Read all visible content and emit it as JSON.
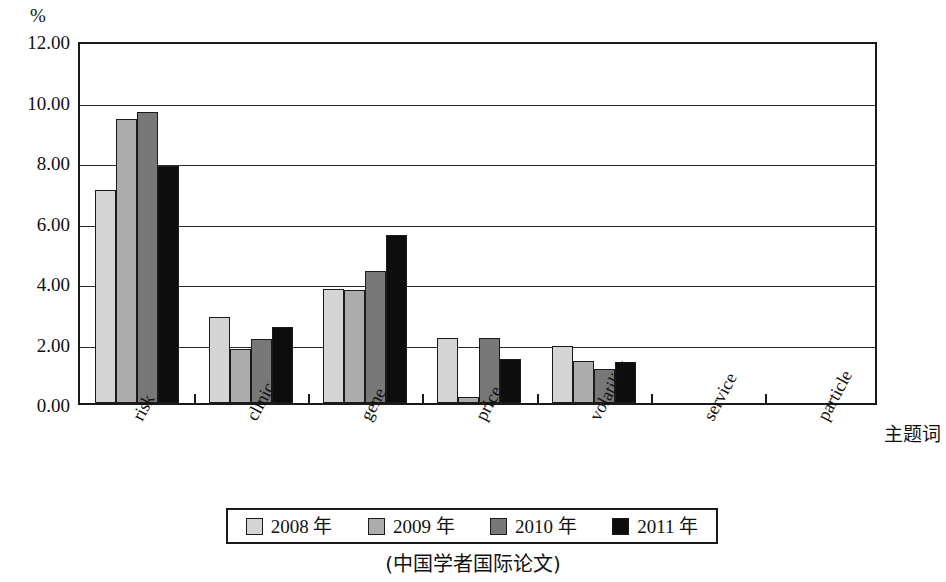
{
  "chart_data": {
    "type": "bar",
    "title": "",
    "caption": "(中国学者国际论文)",
    "xlabel": "主题词",
    "ylabel": "%",
    "ylim": [
      0,
      12
    ],
    "yticks": [
      "0.00",
      "2.00",
      "4.00",
      "6.00",
      "8.00",
      "10.00",
      "12.00"
    ],
    "ytick_values": [
      0,
      2,
      4,
      6,
      8,
      10,
      12
    ],
    "grid": true,
    "legend_position": "bottom",
    "categories": [
      "risk",
      "clinic",
      "gene",
      "price",
      "volatility",
      "service",
      "particle"
    ],
    "series": [
      {
        "name": "2008 年",
        "color": "#d4d4d4",
        "values": [
          7.05,
          2.85,
          3.78,
          2.15,
          1.88,
          0.0,
          0.0
        ]
      },
      {
        "name": "2009 年",
        "color": "#acacac",
        "values": [
          9.4,
          1.78,
          3.72,
          0.2,
          1.4,
          0.0,
          0.0
        ]
      },
      {
        "name": "2010 年",
        "color": "#787878",
        "values": [
          9.62,
          2.1,
          4.35,
          2.15,
          1.12,
          0.0,
          0.0
        ]
      },
      {
        "name": "2011 年",
        "color": "#0d0d0d",
        "values": [
          7.82,
          2.5,
          5.55,
          1.45,
          1.35,
          0.0,
          0.0
        ]
      }
    ]
  },
  "colors": {
    "axis": "#1a1a1a",
    "grid": "#2a2a2a",
    "background": "#ffffff"
  }
}
